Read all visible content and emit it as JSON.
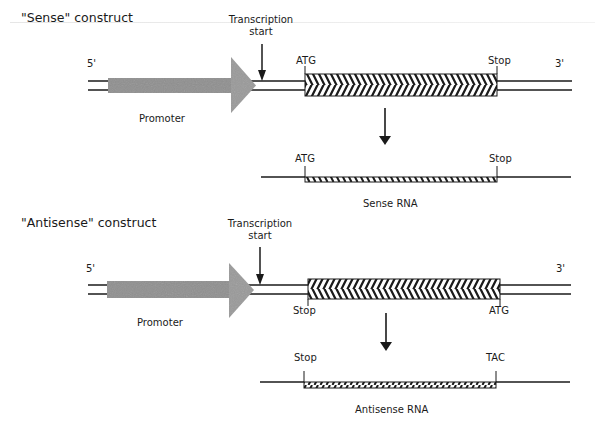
{
  "sense": {
    "title": "\"Sense\" construct",
    "five_prime": "5'",
    "three_prime": "3'",
    "transcription_start": [
      "Transcription",
      "start"
    ],
    "promoter": "Promoter",
    "start_codon": "ATG",
    "stop_codon": "Stop",
    "rna": {
      "left_label": "ATG",
      "right_label": "Stop",
      "caption": "Sense RNA"
    }
  },
  "antisense": {
    "title": "\"Antisense\" construct",
    "five_prime": "5'",
    "three_prime": "3'",
    "transcription_start": [
      "Transcription",
      "start"
    ],
    "promoter": "Promoter",
    "left_codon": "Stop",
    "right_codon": "ATG",
    "rna": {
      "left_label": "Stop",
      "right_label": "TAC",
      "caption": "Antisense RNA"
    }
  },
  "colors": {
    "promoter_fill": "#9a9a9a",
    "line": "#1a1a1a"
  }
}
